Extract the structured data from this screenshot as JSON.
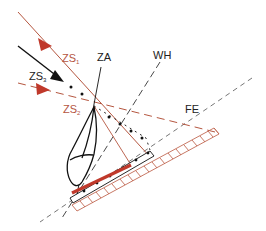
{
  "diagram": {
    "type": "dental radiography projection geometry",
    "colors": {
      "red_accent": "#c0392b",
      "red_line": "#b5563f",
      "black": "#111111",
      "grey_dash": "#555555"
    },
    "labels": {
      "zs1": {
        "main": "ZS",
        "sub": "1"
      },
      "zs2": {
        "main": "ZS",
        "sub": "2"
      },
      "zs3": {
        "main": "ZS",
        "sub": "3"
      },
      "za": "ZA",
      "wh": "WH",
      "fe": "FE"
    }
  }
}
